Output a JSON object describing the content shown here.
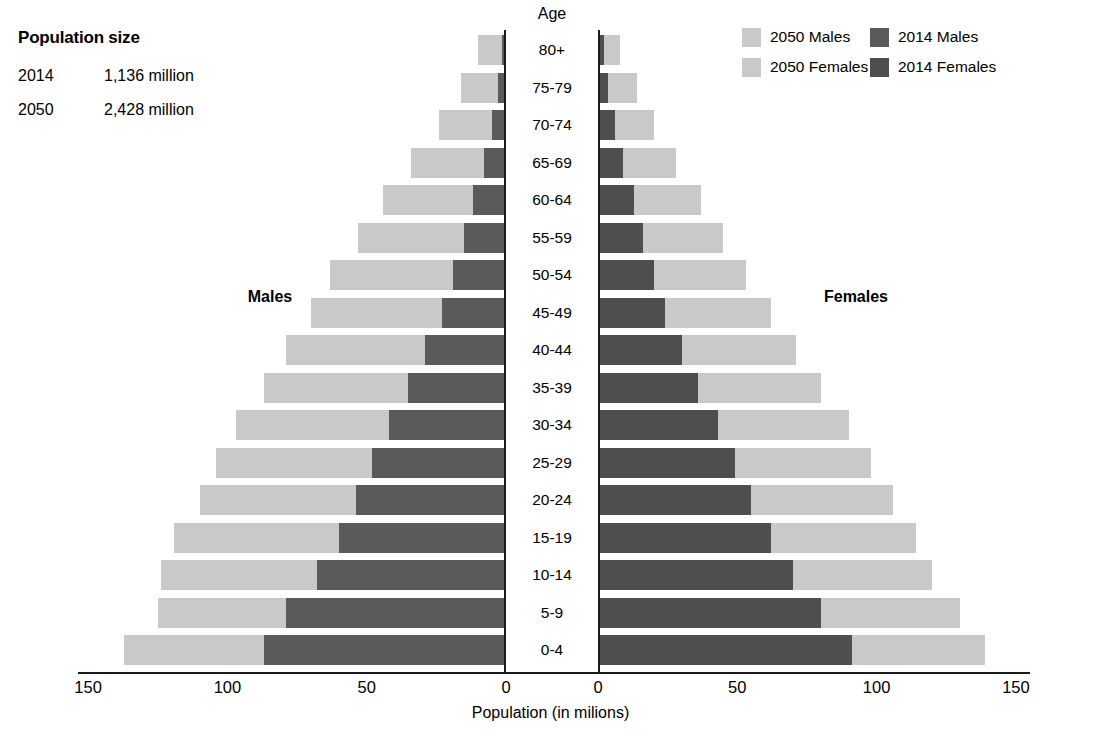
{
  "population_size": {
    "title": "Population size",
    "rows": [
      {
        "year": "2014",
        "value": "1,136 million"
      },
      {
        "year": "2050",
        "value": "2,428 million"
      }
    ]
  },
  "legend": {
    "items": [
      {
        "label": "2050 Males",
        "color": "#c9c9c9"
      },
      {
        "label": "2014 Males",
        "color": "#5a5a5a"
      },
      {
        "label": "2050 Females",
        "color": "#c9c9c9"
      },
      {
        "label": "2014 Females",
        "color": "#4e4e4e"
      }
    ]
  },
  "annotations": {
    "age_header": "Age",
    "males": "Males",
    "females": "Females"
  },
  "colors": {
    "light_2050": "#c9c9c9",
    "dark_2014_male": "#5a5a5a",
    "dark_2014_female": "#4e4e4e",
    "axis": "#1a1a1a",
    "background": "#ffffff"
  },
  "chart_data": {
    "type": "bar",
    "subtype": "population-pyramid",
    "title": "",
    "xlabel": "Population (in milions)",
    "ylabel": "Age",
    "xlim_left": [
      150,
      0
    ],
    "xlim_right": [
      0,
      150
    ],
    "xticks_left": [
      "150",
      "100",
      "50",
      "0"
    ],
    "xticks_right": [
      "0",
      "50",
      "100",
      "150"
    ],
    "grid": false,
    "legend_position": "top-right",
    "categories": [
      "0-4",
      "5-9",
      "10-14",
      "15-19",
      "20-24",
      "25-29",
      "30-34",
      "35-39",
      "40-44",
      "45-49",
      "50-54",
      "55-59",
      "60-64",
      "65-69",
      "70-74",
      "75-79",
      "80+"
    ],
    "series": [
      {
        "name": "2014 Males",
        "side": "left",
        "values": [
          87,
          79,
          68,
          60,
          54,
          48,
          42,
          35,
          29,
          23,
          19,
          15,
          12,
          8,
          5,
          3,
          1.5
        ]
      },
      {
        "name": "2050 Males",
        "side": "left",
        "values": [
          137,
          125,
          124,
          119,
          110,
          104,
          97,
          87,
          79,
          70,
          63,
          53,
          44,
          34,
          24,
          16,
          10
        ]
      },
      {
        "name": "2014 Females",
        "side": "right",
        "values": [
          91,
          80,
          70,
          62,
          55,
          49,
          43,
          36,
          30,
          24,
          20,
          16,
          13,
          9,
          6,
          3.5,
          2
        ]
      },
      {
        "name": "2050 Females",
        "side": "right",
        "values": [
          139,
          130,
          120,
          114,
          106,
          98,
          90,
          80,
          71,
          62,
          53,
          45,
          37,
          28,
          20,
          14,
          8
        ]
      }
    ]
  }
}
